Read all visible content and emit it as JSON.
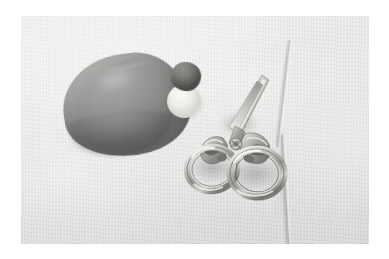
{
  "image": {
    "title": "Needlework tools on light fabric",
    "description": "Black and white photograph of sewing items arranged on a pale cloth background",
    "medium": "photograph",
    "color_mode": "grayscale",
    "canvas": {
      "width": 389,
      "height": 259
    },
    "print_area": {
      "left": 21,
      "top": 16,
      "width": 348,
      "height": 228
    }
  },
  "palette": {
    "paper_white": "#ffffff",
    "fabric_light": "#f2f2f1",
    "fabric_mid": "#e4e4e3",
    "fabric_shadow": "#d6d6d5",
    "stone_light": "#a7a7a5",
    "stone_mid": "#8e8e8c",
    "stone_dark": "#747473",
    "bead_dark": "#6c6c69",
    "metal_light": "#fafaf8",
    "metal_mid": "#b9b9b6",
    "metal_dark": "#6f6f6c"
  },
  "subjects": [
    {
      "id": "stone",
      "label": "Stone",
      "description": "Large smooth rounded gray stone or pincushion, left of center",
      "tone": "medium gray",
      "position": "left"
    },
    {
      "id": "bead",
      "label": "Bead",
      "description": "Small dark rounded bead or thimble resting on a pale base",
      "tone": "dark gray",
      "position": "upper center"
    },
    {
      "id": "bead-base",
      "label": "Pale base",
      "description": "Small light colored object beneath the dark bead",
      "tone": "near white",
      "position": "upper center"
    },
    {
      "id": "scissors",
      "label": "Embroidery scissors",
      "description": "Ornate metal embroidery scissors with filigree handles and two large round finger loops, blades angled up to the right",
      "tone": "light metallic",
      "position": "center right"
    },
    {
      "id": "needle",
      "label": "Needle",
      "description": "Long thin needle or fabric crease running diagonally from top to bottom along the right side",
      "tone": "faint line",
      "position": "right"
    }
  ],
  "background": {
    "label": "Fabric",
    "description": "Plain pale woven cloth filling the frame, lit from the upper left"
  },
  "lighting": {
    "direction": "upper left",
    "shadow_note": "Soft shadow falls to the lower right of the stone and under the scissor loops"
  }
}
